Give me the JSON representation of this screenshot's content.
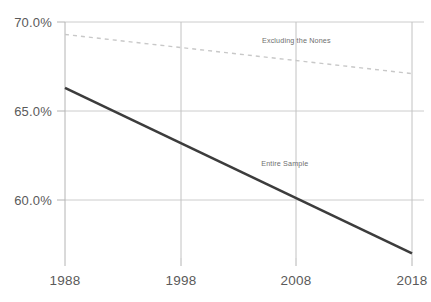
{
  "chart_data": {
    "type": "line",
    "title": "",
    "subtitle": "",
    "xlabel": "",
    "ylabel": "",
    "xlim": [
      1988,
      2018
    ],
    "ylim": [
      56.35,
      70.0
    ],
    "grid": true,
    "legend_position": "inline-annotation",
    "x_ticks": [
      "1988",
      "1998",
      "2008",
      "2018"
    ],
    "x_tick_values": [
      1988,
      1998,
      2008,
      2018
    ],
    "y_ticks": [
      "70.0%",
      "65.0%",
      "60.0%"
    ],
    "y_tick_values": [
      70.0,
      65.0,
      60.0
    ],
    "x": [
      1988,
      2018
    ],
    "series": [
      {
        "name": "Excluding the Nones",
        "values": [
          69.3,
          67.1
        ],
        "style": "dashed",
        "color": "#c8c8c8",
        "label_x": 2008,
        "label_y": 69.0
      },
      {
        "name": "Entire Sample",
        "values": [
          66.3,
          57.0
        ],
        "style": "solid",
        "color": "#3c3c3c",
        "label_x": 2007,
        "label_y": 62.1
      }
    ]
  },
  "axes": {
    "axis_color": "#b4b4b4",
    "grid_color": "#cccccc",
    "tick_label_color": "#5a5a5a"
  }
}
